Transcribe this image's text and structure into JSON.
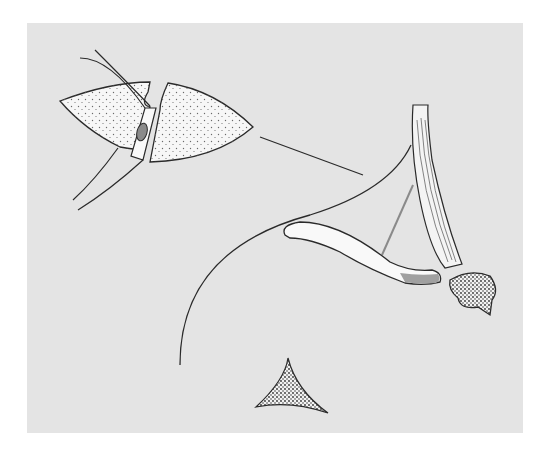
{
  "figure": {
    "type": "anatomical-illustration",
    "caption": "",
    "colors": {
      "page_background": "#ffffff",
      "panel_background": "#e4e4e4",
      "outline": "#2a2a2a",
      "tissue_fill": "#f7f7f7",
      "stipple": "#6a6a6a",
      "accent_gray": "#8a8a8a"
    },
    "elements": [
      {
        "name": "lung-section-inset",
        "description": "lens-shaped tissue section with stippled alveolar texture and central vessel"
      },
      {
        "name": "leader-line",
        "description": "straight line from inset toward tendon"
      },
      {
        "name": "tendon-bundle",
        "description": "vertical fibrous band descending to bone head"
      },
      {
        "name": "curved-outline",
        "description": "long curved contour line"
      },
      {
        "name": "clavicle-like-bone",
        "description": "elongated curved bone with shaded tip"
      },
      {
        "name": "bone-head",
        "description": "rounded cancellous bone cross-section"
      },
      {
        "name": "thin-strap",
        "description": "gray thin line joining bone"
      },
      {
        "name": "triangular-section",
        "description": "small stippled triangular cross-section"
      }
    ]
  }
}
